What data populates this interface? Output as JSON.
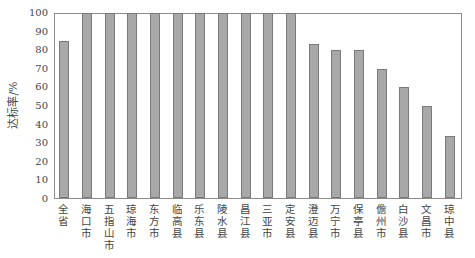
{
  "chart_data": {
    "type": "bar",
    "title": "",
    "xlabel": "",
    "ylabel": "达标率/%",
    "ylim": [
      0,
      100
    ],
    "yticks": [
      0,
      10,
      20,
      30,
      40,
      50,
      60,
      70,
      80,
      90,
      100
    ],
    "grid": false,
    "legend": null,
    "bar_color": "#a8a8a8",
    "categories": [
      "全省",
      "海口市",
      "五指山市",
      "琼海市",
      "东方市",
      "临高县",
      "乐东县",
      "陵水县",
      "昌江县",
      "三亚市",
      "定安县",
      "澄迈县",
      "万宁市",
      "保亭县",
      "儋州市",
      "白沙县",
      "文昌市",
      "琼中县"
    ],
    "values": [
      85,
      100,
      100,
      100,
      100,
      100,
      100,
      100,
      100,
      100,
      100,
      83.3,
      80,
      80,
      70,
      60,
      50,
      33.3
    ]
  }
}
